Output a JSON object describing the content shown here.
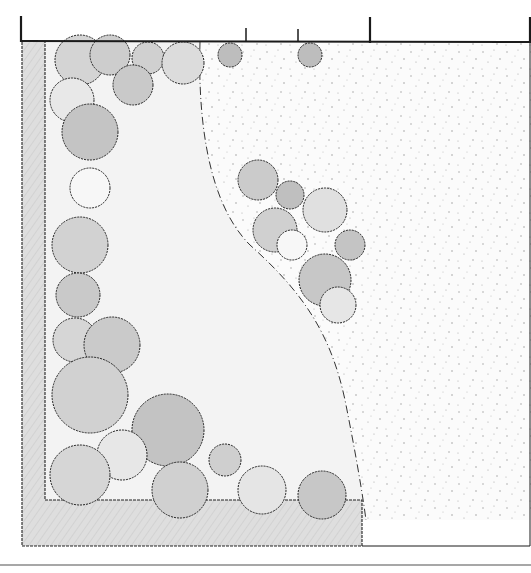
{
  "figure": {
    "type": "landscape-garden-plan",
    "style": "hand-drawn pencil sketch, plan view",
    "text_labels": []
  },
  "colors": {
    "background": "#ffffff",
    "outline": "#1a1a1a",
    "lawn": "#f4f4f4",
    "hedge": "#d9d9d9",
    "shrub_dark": "#bdbdbd",
    "shrub_mid": "#cfcfcf",
    "shrub_light": "#ececec",
    "gravel_dot": "#9a9a9a",
    "bottom_rule": "#8a8a8a"
  },
  "elements": {
    "boundary_fence": {
      "description": "top boundary line with posts",
      "posts_x": [
        21,
        246,
        298,
        370,
        531
      ]
    },
    "perimeter_hedge": {
      "description": "L-shaped clipped hedge along left and bottom edges"
    },
    "lawn": {
      "description": "curved lawn area bounded by dash-dot edge"
    },
    "gravel_area": {
      "description": "stippled gravel/meadow area on the right"
    },
    "shrub_island": {
      "description": "group of shrubs within gravel area"
    },
    "bottom_rule": {
      "description": "horizontal rule below drawing"
    }
  }
}
